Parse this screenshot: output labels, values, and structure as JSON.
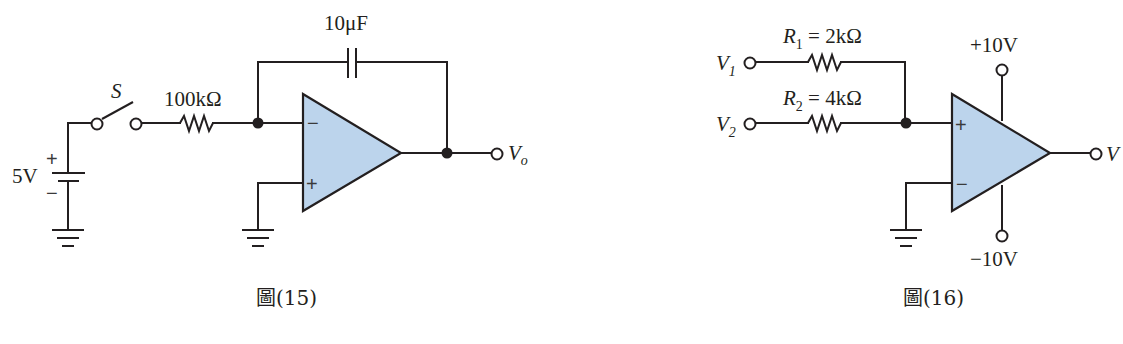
{
  "figure15": {
    "caption": "圖(15)",
    "switch_label": "S",
    "resistor_label": "100kΩ",
    "capacitor_label": "10μF",
    "source_label": "5V",
    "source_plus": "+",
    "source_minus": "−",
    "opamp_inverting": "−",
    "opamp_noninverting": "+",
    "output_label": "V",
    "output_sub": "o"
  },
  "figure16": {
    "caption": "圖(16)",
    "input1_label": "V",
    "input1_sub": "1",
    "input2_label": "V",
    "input2_sub": "2",
    "r1_name": "R",
    "r1_sub": "1",
    "r1_value": " = 2kΩ",
    "r2_name": "R",
    "r2_sub": "2",
    "r2_value": " = 4kΩ",
    "supply_pos": "+10V",
    "supply_neg": "−10V",
    "opamp_noninverting": "+",
    "opamp_inverting": "−",
    "output_label": "V"
  },
  "colors": {
    "opamp_fill": "#bcd4ec",
    "line": "#231f20"
  }
}
